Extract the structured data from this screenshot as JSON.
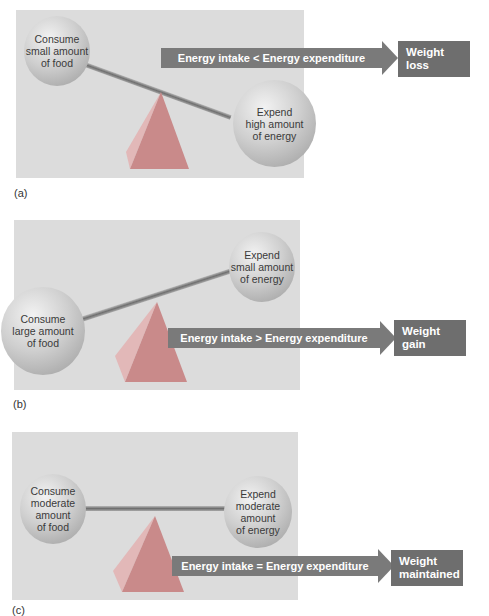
{
  "panels": [
    {
      "id": "a",
      "label": "(a)",
      "left_ball": "Consume\nsmall amount\nof food",
      "right_ball": "Expend\nhigh amount\nof energy",
      "arrow_text": "Energy intake < Energy expenditure",
      "result": "Weight loss"
    },
    {
      "id": "b",
      "label": "(b)",
      "left_ball": "Consume\nlarge amount\nof food",
      "right_ball": "Expend\nsmall amount\nof energy",
      "arrow_text": "Energy intake > Energy expenditure",
      "result": "Weight gain"
    },
    {
      "id": "c",
      "label": "(c)",
      "left_ball": "Consume\nmoderate\namount\nof food",
      "right_ball": "Expend\nmoderate\namount\nof energy",
      "arrow_text": "Energy intake = Energy expenditure",
      "result": "Weight\nmaintained"
    }
  ],
  "colors": {
    "panel_bg": "#dcdcdc",
    "arrow": "#7a7a7a",
    "result_box": "#6e6e6e",
    "pyramid": "#c98a8a"
  }
}
